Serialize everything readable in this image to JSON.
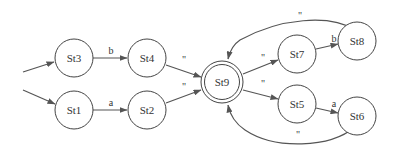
{
  "diagram": {
    "type": "finite-state-automaton",
    "nodes": [
      {
        "id": "St1",
        "label": "St1",
        "accepting": false
      },
      {
        "id": "St2",
        "label": "St2",
        "accepting": false
      },
      {
        "id": "St3",
        "label": "St3",
        "accepting": false
      },
      {
        "id": "St4",
        "label": "St4",
        "accepting": false
      },
      {
        "id": "St5",
        "label": "St5",
        "accepting": false
      },
      {
        "id": "St6",
        "label": "St6",
        "accepting": false
      },
      {
        "id": "St7",
        "label": "St7",
        "accepting": false
      },
      {
        "id": "St8",
        "label": "St8",
        "accepting": false
      },
      {
        "id": "St9",
        "label": "St9",
        "accepting": true
      }
    ],
    "edges": [
      {
        "from": "start",
        "to": "St3",
        "label": ""
      },
      {
        "from": "start",
        "to": "St1",
        "label": ""
      },
      {
        "from": "St3",
        "to": "St4",
        "label": "b"
      },
      {
        "from": "St1",
        "to": "St2",
        "label": "a"
      },
      {
        "from": "St4",
        "to": "St9",
        "label": "\""
      },
      {
        "from": "St2",
        "to": "St9",
        "label": "\""
      },
      {
        "from": "St9",
        "to": "St7",
        "label": "\""
      },
      {
        "from": "St9",
        "to": "St5",
        "label": "\""
      },
      {
        "from": "St7",
        "to": "St8",
        "label": "b"
      },
      {
        "from": "St5",
        "to": "St6",
        "label": "a"
      },
      {
        "from": "St8",
        "to": "St9",
        "label": "\""
      },
      {
        "from": "St6",
        "to": "St9",
        "label": "\""
      }
    ]
  }
}
